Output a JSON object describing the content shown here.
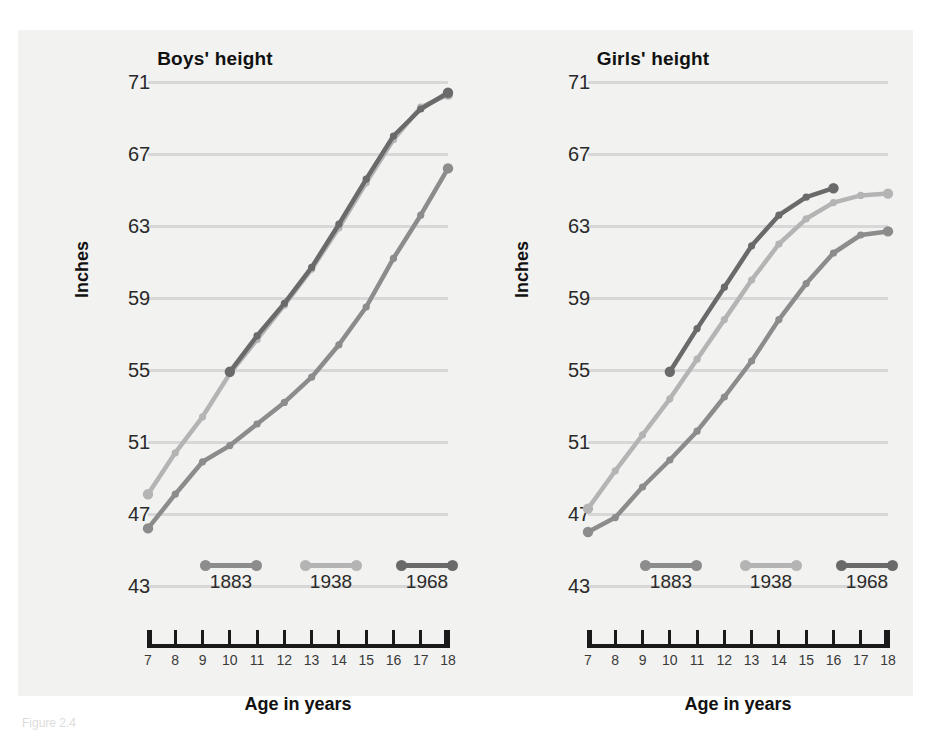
{
  "figure": {
    "background": "#f2f2f0",
    "caption_faint": "Figure 2.4"
  },
  "axis": {
    "ylabel": "Inches",
    "xlabel": "Age in years",
    "yticks": [
      "71",
      "67",
      "63",
      "59",
      "55",
      "51",
      "47",
      "43"
    ],
    "xticks": [
      "7",
      "8",
      "9",
      "10",
      "11",
      "12",
      "13",
      "14",
      "15",
      "16",
      "17",
      "18"
    ],
    "ylim": [
      43,
      71
    ],
    "xlim": [
      7,
      18
    ]
  },
  "legend": {
    "position": "inside-bottom",
    "items": [
      {
        "label": "1883",
        "color": "#8c8c8c"
      },
      {
        "label": "1938",
        "color": "#b4b4b4"
      },
      {
        "label": "1968",
        "color": "#6a6a6a"
      }
    ]
  },
  "chart_data": [
    {
      "type": "line",
      "title": "Boys' height",
      "xlabel": "Age in years",
      "ylabel": "Inches",
      "ylim": [
        43,
        71
      ],
      "xlim": [
        7,
        18
      ],
      "grid": true,
      "x": [
        7,
        8,
        9,
        10,
        11,
        12,
        13,
        14,
        15,
        16,
        17,
        18
      ],
      "series": [
        {
          "name": "1883",
          "color": "#8c8c8c",
          "values": [
            46.2,
            48.1,
            49.9,
            50.8,
            52.0,
            53.2,
            54.6,
            56.4,
            58.5,
            61.2,
            63.6,
            66.2
          ]
        },
        {
          "name": "1938",
          "color": "#b4b4b4",
          "values": [
            48.1,
            50.4,
            52.4,
            54.8,
            56.7,
            58.6,
            60.6,
            62.9,
            65.4,
            67.8,
            69.6,
            70.3
          ]
        },
        {
          "name": "1968",
          "color": "#6a6a6a",
          "values": [
            null,
            null,
            null,
            54.9,
            56.9,
            58.7,
            60.7,
            63.1,
            65.6,
            68.0,
            69.5,
            70.4
          ]
        }
      ]
    },
    {
      "type": "line",
      "title": "Girls' height",
      "xlabel": "Age in years",
      "ylabel": "Inches",
      "ylim": [
        43,
        71
      ],
      "xlim": [
        7,
        18
      ],
      "grid": true,
      "x": [
        7,
        8,
        9,
        10,
        11,
        12,
        13,
        14,
        15,
        16,
        17,
        18
      ],
      "series": [
        {
          "name": "1883",
          "color": "#8c8c8c",
          "values": [
            46.0,
            46.8,
            48.5,
            50.0,
            51.6,
            53.5,
            55.5,
            57.8,
            59.8,
            61.5,
            62.5,
            62.7
          ]
        },
        {
          "name": "1938",
          "color": "#b4b4b4",
          "values": [
            47.3,
            49.4,
            51.4,
            53.4,
            55.6,
            57.8,
            60.0,
            62.0,
            63.4,
            64.3,
            64.7,
            64.8
          ]
        },
        {
          "name": "1968",
          "color": "#6a6a6a",
          "values": [
            null,
            null,
            null,
            54.9,
            57.3,
            59.6,
            61.9,
            63.6,
            64.6,
            65.1,
            null,
            null
          ]
        }
      ]
    }
  ]
}
